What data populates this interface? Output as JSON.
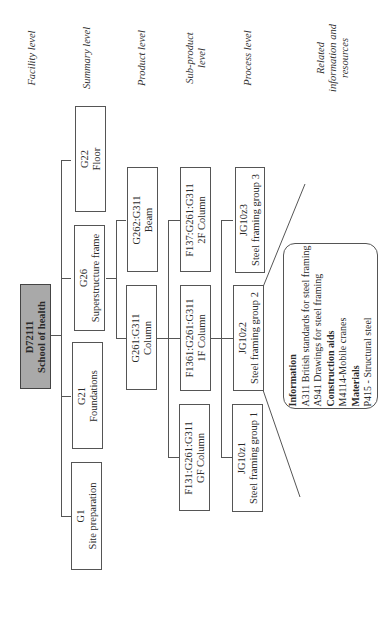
{
  "levels": {
    "facility": "Facility level",
    "summary": "Summary level",
    "product": "Product level",
    "subproduct_line1": "Sub-product",
    "subproduct_line2": "level",
    "process": "Process level",
    "related_line1": "Related",
    "related_line2": "information and",
    "related_line3": "resources"
  },
  "root": {
    "code": "D72111",
    "name": "School of health"
  },
  "summary": [
    {
      "code": "G22",
      "name": "Floor"
    },
    {
      "code": "G26",
      "name": "Superstructure frame"
    },
    {
      "code": "G21",
      "name": "Foundations"
    },
    {
      "code": "G1",
      "name": "Site preparation"
    }
  ],
  "product": [
    {
      "code": "G262:G311",
      "name": "Beam"
    },
    {
      "code": "G261:G311",
      "name": "Column"
    }
  ],
  "subproduct": [
    {
      "code": "F137:G261:G311",
      "name": "2F Column"
    },
    {
      "code": "F1361:G261:G311",
      "name": "1F Column"
    },
    {
      "code": "F131:G261:G311",
      "name": "GF Column"
    }
  ],
  "process": [
    {
      "code": "JG10z3",
      "name": "Steel framing group 3"
    },
    {
      "code": "JG10z2",
      "name": "Steel framing group 2"
    },
    {
      "code": "JG10z1",
      "name": "Steel framing group 1"
    }
  ],
  "resources": {
    "information_heading": "Information",
    "information_items": [
      "A311 British standards for steel framing",
      "A941 Drawings for steel framing"
    ],
    "construction_aids_heading": "Construction aids",
    "construction_aids_items": [
      "M4114-Mobile cranes"
    ],
    "materials_heading": "Materials",
    "materials_items": [
      "P415 - Structural steel"
    ]
  },
  "colors": {
    "root_fill": "#a9a9a9",
    "line": "#555555",
    "background": "#ffffff"
  }
}
